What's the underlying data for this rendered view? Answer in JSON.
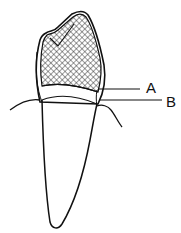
{
  "diagram": {
    "labels": [
      {
        "id": "A",
        "text": "A",
        "target": "crown margin / restoration edge"
      },
      {
        "id": "B",
        "text": "B",
        "target": "gingival margin / cervical line"
      }
    ],
    "colors": {
      "stroke": "#111111",
      "background": "#ffffff",
      "hatch": "#222222"
    },
    "parts": [
      "crown-hatched",
      "cervical-band",
      "root",
      "gingiva-left",
      "gingiva-right"
    ]
  }
}
